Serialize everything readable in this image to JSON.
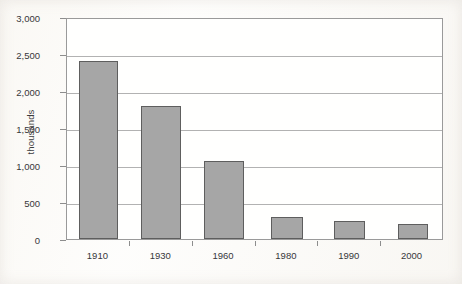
{
  "chart_data": {
    "type": "bar",
    "title": "",
    "subtitle": "",
    "xlabel": "",
    "ylabel": "thousands",
    "categories": [
      "1910",
      "1930",
      "1960",
      "1980",
      "1990",
      "2000"
    ],
    "values": [
      2400,
      1800,
      1050,
      300,
      240,
      200
    ],
    "series": [
      {
        "name": "",
        "values": [
          2400,
          1800,
          1050,
          300,
          240,
          200
        ]
      }
    ],
    "ylim": [
      0,
      3000
    ],
    "ytick_values": [
      0,
      500,
      1000,
      1500,
      2000,
      2500,
      3000
    ],
    "ytick_labels": [
      "0",
      "500",
      "1,000",
      "1,500",
      "2,000",
      "2,500",
      "3,000"
    ],
    "grid": true,
    "grid_axis": "y",
    "legend": false,
    "legend_position": "none",
    "annotations": [],
    "bar_color": "#a6a6a6",
    "bar_edge_color": "#5e5e5e",
    "grid_color": "#b2b2b2",
    "frame_color": "#9a9a9a",
    "text_color": "#37373a",
    "background_color": "#fdfcfa"
  }
}
